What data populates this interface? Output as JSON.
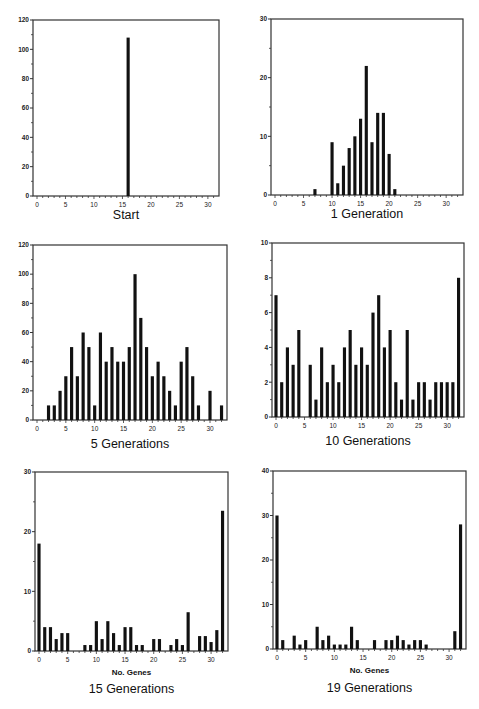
{
  "figure": {
    "background": "#ffffff",
    "bar_color": "#111111",
    "frame_color": "#333333"
  },
  "chart_data": [
    {
      "id": "start",
      "type": "bar",
      "title": "Start",
      "xlabel": "",
      "ylabel": "",
      "xlim": [
        0,
        31
      ],
      "ylim": [
        0,
        120
      ],
      "xticks": [
        0,
        5,
        10,
        15,
        20,
        25,
        30
      ],
      "yticks": [
        0,
        20,
        40,
        60,
        80,
        100,
        120
      ],
      "grid": false,
      "x": [
        16
      ],
      "values": [
        108
      ]
    },
    {
      "id": "gen1",
      "type": "bar",
      "title": "1 Generation",
      "xlabel": "",
      "ylabel": "",
      "xlim": [
        0,
        32
      ],
      "ylim": [
        0,
        30
      ],
      "xticks": [
        0,
        5,
        10,
        15,
        20,
        25,
        30
      ],
      "yticks": [
        0,
        10,
        20,
        30
      ],
      "grid": false,
      "x": [
        7,
        10,
        11,
        12,
        13,
        14,
        15,
        16,
        17,
        18,
        19,
        20,
        21
      ],
      "values": [
        1,
        9,
        2,
        5,
        8,
        10,
        13,
        22,
        9,
        14,
        14,
        7,
        1
      ]
    },
    {
      "id": "gen5",
      "type": "bar",
      "title": "5 Generations",
      "xlabel": "",
      "ylabel": "",
      "xlim": [
        0,
        32
      ],
      "ylim": [
        0,
        120
      ],
      "xticks": [
        0,
        5,
        10,
        15,
        20,
        25,
        30
      ],
      "yticks": [
        0,
        20,
        40,
        60,
        80,
        100,
        120
      ],
      "grid": false,
      "x": [
        2,
        3,
        4,
        5,
        6,
        7,
        8,
        9,
        10,
        11,
        12,
        13,
        14,
        15,
        16,
        17,
        18,
        19,
        20,
        21,
        22,
        23,
        24,
        25,
        26,
        27,
        28,
        30,
        32
      ],
      "values": [
        10,
        10,
        20,
        30,
        50,
        30,
        60,
        50,
        10,
        60,
        40,
        50,
        40,
        40,
        50,
        100,
        70,
        50,
        30,
        40,
        30,
        20,
        10,
        40,
        50,
        30,
        10,
        20,
        10
      ]
    },
    {
      "id": "gen10",
      "type": "bar",
      "title": "10 Generations",
      "xlabel": "",
      "ylabel": "",
      "xlim": [
        0,
        32
      ],
      "ylim": [
        0,
        10
      ],
      "xticks": [
        0,
        5,
        10,
        15,
        20,
        25,
        30
      ],
      "yticks": [
        0,
        2,
        4,
        6,
        8,
        10
      ],
      "grid": false,
      "x": [
        0,
        1,
        2,
        3,
        4,
        6,
        7,
        8,
        9,
        10,
        11,
        12,
        13,
        14,
        15,
        16,
        17,
        18,
        19,
        20,
        21,
        22,
        23,
        24,
        25,
        26,
        27,
        28,
        29,
        30,
        31,
        32
      ],
      "values": [
        7,
        2,
        4,
        3,
        5,
        3,
        1,
        4,
        2,
        3,
        2,
        4,
        5,
        3,
        4,
        3,
        6,
        7,
        4,
        5,
        2,
        1,
        5,
        1,
        2,
        2,
        1,
        2,
        2,
        2,
        2,
        8
      ]
    },
    {
      "id": "gen15",
      "type": "bar",
      "title": "15 Generations",
      "xlabel": "No. Genes",
      "ylabel": "",
      "xlim": [
        0,
        32
      ],
      "ylim": [
        0,
        30
      ],
      "xticks": [
        0,
        5,
        10,
        15,
        20,
        25,
        30
      ],
      "yticks": [
        0,
        10,
        20,
        30
      ],
      "grid": false,
      "x": [
        0,
        1,
        2,
        3,
        4,
        5,
        8,
        9,
        10,
        11,
        12,
        13,
        14,
        15,
        16,
        17,
        18,
        20,
        21,
        23,
        24,
        25,
        26,
        28,
        29,
        30,
        31,
        32
      ],
      "values": [
        18,
        4,
        4,
        2,
        3,
        3,
        1,
        1,
        5,
        2,
        5,
        3,
        1,
        4,
        4,
        1,
        1,
        2,
        2,
        1,
        2,
        1,
        6.5,
        2.5,
        2.5,
        1.5,
        3.5,
        23.5
      ]
    },
    {
      "id": "gen19",
      "type": "bar",
      "title": "19 Generations",
      "xlabel": "No. Genes",
      "ylabel": "",
      "xlim": [
        0,
        32
      ],
      "ylim": [
        0,
        40
      ],
      "xticks": [
        0,
        5,
        10,
        15,
        20,
        25,
        30
      ],
      "yticks": [
        0,
        10,
        20,
        30,
        40
      ],
      "grid": false,
      "x": [
        0,
        1,
        3,
        4,
        5,
        7,
        8,
        9,
        10,
        11,
        12,
        13,
        14,
        17,
        19,
        20,
        21,
        22,
        23,
        24,
        25,
        26,
        31,
        32
      ],
      "values": [
        30,
        2,
        3,
        1,
        2,
        5,
        2,
        3,
        1,
        1,
        1,
        5,
        2,
        2,
        2,
        2,
        3,
        2,
        1,
        2,
        2,
        1,
        4,
        28
      ]
    }
  ]
}
